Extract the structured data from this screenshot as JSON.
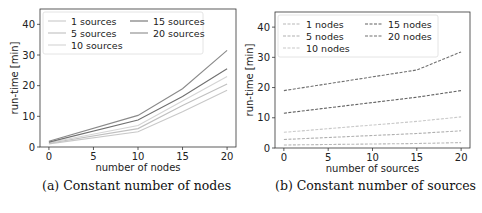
{
  "chart_data": [
    {
      "type": "line",
      "caption": "(a) Constant number of nodes",
      "xlabel": "number of nodes",
      "ylabel": "run-time [min]",
      "x": [
        0,
        10,
        15,
        20
      ],
      "xticks": [
        "0",
        "5",
        "10",
        "15",
        "20"
      ],
      "yticks": [
        "0",
        "10",
        "20",
        "30",
        "40"
      ],
      "xlim": [
        -1,
        21
      ],
      "ylim": [
        0,
        45
      ],
      "grid": false,
      "legend_position": "upper left",
      "series": [
        {
          "name": "1 sources",
          "values": [
            1.0,
            5.0,
            11.5,
            18.5
          ],
          "color": "#c8c8c8"
        },
        {
          "name": "5 sources",
          "values": [
            1.2,
            6.0,
            13.5,
            20.5
          ],
          "color": "#c0c0c0"
        },
        {
          "name": "10 sources",
          "values": [
            1.4,
            7.0,
            15.0,
            23.0
          ],
          "color": "#d4d4d4"
        },
        {
          "name": "15 sources",
          "values": [
            1.6,
            8.8,
            16.5,
            25.5
          ],
          "color": "#707070"
        },
        {
          "name": "20 sources",
          "values": [
            1.9,
            10.3,
            19.0,
            31.5
          ],
          "color": "#8a8a8a"
        }
      ]
    },
    {
      "type": "line",
      "caption": "(b) Constant number of sources",
      "xlabel": "number of sources",
      "ylabel": "run-time [min]",
      "x": [
        0,
        15,
        20
      ],
      "xticks": [
        "0",
        "5",
        "10",
        "15",
        "20"
      ],
      "yticks": [
        "0",
        "10",
        "20",
        "30",
        "40"
      ],
      "xlim": [
        -1,
        21
      ],
      "ylim": [
        0,
        45
      ],
      "grid": false,
      "legend_position": "upper left",
      "series": [
        {
          "name": "1 nodes",
          "values": [
            1.0,
            1.5,
            1.8
          ],
          "color": "#b8b8b8",
          "dashed": true
        },
        {
          "name": "5 nodes",
          "values": [
            2.8,
            4.8,
            5.7
          ],
          "color": "#b0b0b0",
          "dashed": true
        },
        {
          "name": "10 nodes",
          "values": [
            5.2,
            8.8,
            10.3
          ],
          "color": "#c8c8c8",
          "dashed": true
        },
        {
          "name": "15 nodes",
          "values": [
            11.5,
            16.8,
            19.0
          ],
          "color": "#606060",
          "dashed": true
        },
        {
          "name": "20 nodes",
          "values": [
            19.0,
            25.8,
            31.8
          ],
          "color": "#707070",
          "dashed": true
        }
      ]
    }
  ]
}
